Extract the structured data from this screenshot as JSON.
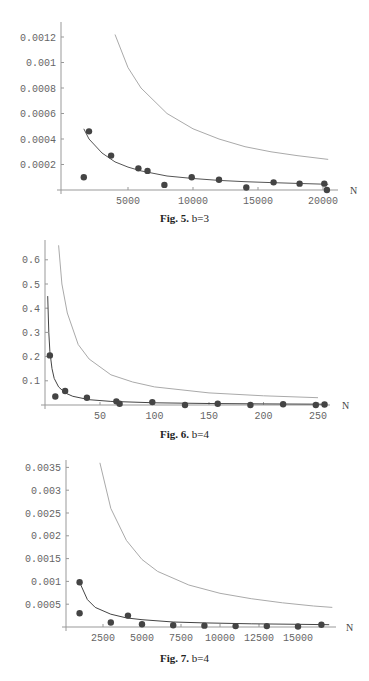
{
  "figures": [
    {
      "caption_label": "Fig. 5.",
      "caption_text": "b=3"
    },
    {
      "caption_label": "Fig. 6.",
      "caption_text": "b=4"
    },
    {
      "caption_label": "Fig. 7.",
      "caption_text": "b=4"
    }
  ],
  "chart_data": [
    {
      "type": "scatter",
      "title": "Fig. 5. b=3",
      "xlabel": "N",
      "ylabel": "",
      "xlim": [
        0,
        20500
      ],
      "ylim": [
        0,
        0.0013
      ],
      "xticks": [
        5000,
        10000,
        15000,
        20000
      ],
      "xtick_labels": [
        "5000",
        "10000",
        "15000",
        "20000"
      ],
      "yticks": [
        0.0002,
        0.0004,
        0.0006,
        0.0008,
        0.001,
        0.0012
      ],
      "ytick_labels": [
        "0.0002",
        "0.0004",
        "0.0006",
        "0.0008",
        "0.001",
        "0.0012"
      ],
      "grid": false,
      "series": [
        {
          "name": "data points",
          "kind": "scatter",
          "color": "#444444",
          "x": [
            1600,
            2000,
            3700,
            5800,
            6500,
            7800,
            9900,
            12000,
            14100,
            16200,
            18200,
            20100,
            20300
          ],
          "y": [
            0.0001,
            0.00046,
            0.00027,
            0.00017,
            0.00015,
            4e-05,
            0.0001,
            8e-05,
            2e-05,
            6e-05,
            5e-05,
            5e-05,
            0.0
          ]
        },
        {
          "name": "fit curve (lower)",
          "kind": "line",
          "color": "#555555",
          "x_range": [
            1600,
            20400
          ],
          "formula": "0.00078/N^?",
          "x": [
            1600,
            2000,
            3000,
            4000,
            5000,
            6000,
            8000,
            10000,
            12000,
            14000,
            16000,
            18000,
            20400
          ],
          "y": [
            0.00048,
            0.0004,
            0.00029,
            0.00022,
            0.00018,
            0.00015,
            0.00011,
            9e-05,
            7.5e-05,
            6.5e-05,
            5.8e-05,
            5.2e-05,
            4.5e-05
          ]
        },
        {
          "name": "upper bound curve",
          "kind": "line",
          "color": "#aaaaaa",
          "x": [
            4000,
            5000,
            6000,
            8000,
            10000,
            12000,
            14000,
            16000,
            18000,
            20400
          ],
          "y": [
            0.00122,
            0.00096,
            0.0008,
            0.0006,
            0.00048,
            0.0004,
            0.00034,
            0.0003,
            0.00027,
            0.00024
          ]
        }
      ]
    },
    {
      "type": "scatter",
      "title": "Fig. 6. b=4",
      "xlabel": "N",
      "ylabel": "",
      "xlim": [
        0,
        262
      ],
      "ylim": [
        0,
        0.66
      ],
      "xticks": [
        50,
        100,
        150,
        200,
        250
      ],
      "xtick_labels": [
        "50",
        "100",
        "150",
        "200",
        "250"
      ],
      "yticks": [
        0.1,
        0.2,
        0.3,
        0.4,
        0.5,
        0.6
      ],
      "ytick_labels": [
        "0.1",
        "0.2",
        "0.3",
        "0.4",
        "0.5",
        "0.6"
      ],
      "grid": false,
      "series": [
        {
          "name": "data points",
          "kind": "scatter",
          "color": "#444444",
          "x": [
            4,
            9,
            18,
            38,
            65,
            68,
            98,
            128,
            158,
            188,
            218,
            248,
            256
          ],
          "y": [
            0.205,
            0.035,
            0.058,
            0.03,
            0.015,
            0.005,
            0.012,
            0.0,
            0.005,
            0.0,
            0.003,
            0.0,
            0.002
          ]
        },
        {
          "name": "fit curve (lower)",
          "kind": "line",
          "color": "#444444",
          "x": [
            2,
            3,
            4,
            6,
            8,
            12,
            18,
            25,
            40,
            60,
            100,
            150,
            200,
            256
          ],
          "y": [
            0.45,
            0.3,
            0.22,
            0.15,
            0.11,
            0.075,
            0.05,
            0.036,
            0.022,
            0.015,
            0.009,
            0.006,
            0.0045,
            0.0035
          ]
        },
        {
          "name": "upper bound curve",
          "kind": "line",
          "color": "#aaaaaa",
          "x": [
            12,
            15,
            20,
            30,
            40,
            60,
            80,
            100,
            150,
            200,
            250
          ],
          "y": [
            0.66,
            0.5,
            0.38,
            0.25,
            0.19,
            0.125,
            0.095,
            0.075,
            0.05,
            0.038,
            0.03
          ]
        }
      ]
    },
    {
      "type": "scatter",
      "title": "Fig. 7. b=4",
      "xlabel": "N",
      "ylabel": "",
      "xlim": [
        0,
        17500
      ],
      "ylim": [
        0,
        0.0036
      ],
      "xticks": [
        2500,
        5000,
        7500,
        10000,
        12500,
        15000
      ],
      "xtick_labels": [
        "2500",
        "5000",
        "7500",
        "10000",
        "12500",
        "15000"
      ],
      "yticks": [
        0.0005,
        0.001,
        0.0015,
        0.002,
        0.0025,
        0.003,
        0.0035
      ],
      "ytick_labels": [
        "0.0005",
        "0.001",
        "0.0015",
        "0.002",
        "0.0025",
        "0.003",
        "0.0035"
      ],
      "grid": false,
      "series": [
        {
          "name": "data points",
          "kind": "scatter",
          "color": "#444444",
          "x": [
            1000,
            1000,
            3000,
            4100,
            5000,
            7000,
            9000,
            11000,
            13000,
            15000,
            16500
          ],
          "y": [
            0.00098,
            0.0003,
            0.0001,
            0.00025,
            6e-05,
            4e-05,
            3e-05,
            2e-05,
            2e-05,
            1e-05,
            5e-05
          ]
        },
        {
          "name": "fit curve (lower)",
          "kind": "line",
          "color": "#444444",
          "x": [
            1000,
            1500,
            2000,
            3000,
            4000,
            5000,
            7000,
            9000,
            12000,
            15000,
            17000
          ],
          "y": [
            0.00098,
            0.0006,
            0.00043,
            0.00028,
            0.0002,
            0.00016,
            0.00011,
            9e-05,
            7e-05,
            6e-05,
            5e-05
          ]
        },
        {
          "name": "upper bound curve",
          "kind": "line",
          "color": "#aaaaaa",
          "x": [
            2300,
            3000,
            4000,
            5000,
            6000,
            8000,
            10000,
            12000,
            14000,
            16000,
            17200
          ],
          "y": [
            0.0036,
            0.0026,
            0.0019,
            0.00148,
            0.00122,
            0.00092,
            0.00074,
            0.00062,
            0.00053,
            0.00046,
            0.00043
          ]
        }
      ]
    }
  ]
}
